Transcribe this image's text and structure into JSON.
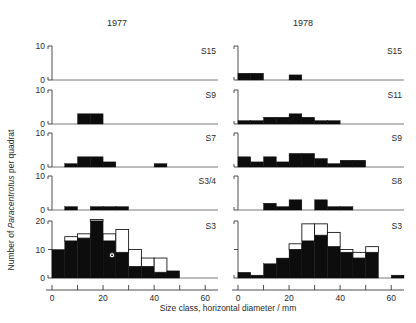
{
  "figure": {
    "column_titles": [
      "1977",
      "1978"
    ],
    "y_axis_label_prefix": "Number of ",
    "y_axis_label_italic": "Paracentrotus",
    "y_axis_label_suffix": " per quadrat",
    "x_axis_label": "Size class, horizontal diameter / mm"
  },
  "chart_data": {
    "type": "bar",
    "title": "",
    "subtitle": "",
    "xlabel": "Size class, horizontal diameter / mm",
    "ylabel": "Number of Paracentrotus per quadrat",
    "grid": false,
    "legend": "none",
    "bin_width": 5,
    "xlim": [
      0,
      65
    ],
    "x_ticks": [
      0,
      10,
      20,
      30,
      40,
      50,
      60
    ],
    "x_tick_labels": [
      "0",
      "20",
      "40",
      "60"
    ],
    "x_labeled_ticks": [
      0,
      20,
      40,
      60
    ],
    "note": "Histograms of sea urchin size-frequency. Solid black bars = one category; open (white outlined) bars stacked above = second category. Rows are sampling sites, columns are years.",
    "panels": [
      {
        "year": "1977",
        "site": "S15",
        "row": 0,
        "column": 0,
        "ylim": [
          0,
          10
        ],
        "y_ticks": [
          0,
          10
        ],
        "y_tick_labels": [
          "0",
          "10"
        ],
        "bins": [
          0,
          5,
          10,
          15,
          20,
          25,
          30,
          35,
          40,
          45,
          50,
          55,
          60
        ],
        "filled": [
          0,
          0,
          0,
          0,
          0,
          0,
          0,
          0,
          0,
          0,
          0,
          0,
          0
        ],
        "open": [
          0,
          0,
          0,
          0,
          0,
          0,
          0,
          0,
          0,
          0,
          0,
          0,
          0
        ]
      },
      {
        "year": "1977",
        "site": "S9",
        "row": 1,
        "column": 0,
        "ylim": [
          0,
          10
        ],
        "y_ticks": [
          0,
          10
        ],
        "y_tick_labels": [
          "0",
          "10"
        ],
        "bins": [
          0,
          5,
          10,
          15,
          20,
          25,
          30,
          35,
          40,
          45,
          50,
          55,
          60
        ],
        "filled": [
          0,
          0,
          3,
          3,
          0,
          0,
          0,
          0,
          0,
          0,
          0,
          0,
          0
        ],
        "open": [
          0,
          0,
          0,
          0,
          0,
          0,
          0,
          0,
          0,
          0,
          0,
          0,
          0
        ]
      },
      {
        "year": "1977",
        "site": "S7",
        "row": 2,
        "column": 0,
        "ylim": [
          0,
          10
        ],
        "y_ticks": [
          0,
          10
        ],
        "y_tick_labels": [
          "0",
          "10"
        ],
        "bins": [
          0,
          5,
          10,
          15,
          20,
          25,
          30,
          35,
          40,
          45,
          50,
          55,
          60
        ],
        "filled": [
          0,
          1,
          3,
          3,
          1.5,
          0,
          0,
          0,
          1,
          0,
          0,
          0,
          0
        ],
        "open": [
          0,
          0,
          0,
          0,
          0,
          0,
          0,
          0,
          0,
          0,
          0,
          0,
          0
        ]
      },
      {
        "year": "1977",
        "site": "S3/4",
        "row": 3,
        "column": 0,
        "ylim": [
          0,
          10
        ],
        "y_ticks": [
          0,
          10
        ],
        "y_tick_labels": [
          "0",
          "10"
        ],
        "bins": [
          0,
          5,
          10,
          15,
          20,
          25,
          30,
          35,
          40,
          45,
          50,
          55,
          60
        ],
        "filled": [
          0,
          1,
          0,
          1,
          1,
          1,
          0,
          0,
          0,
          0,
          0,
          0,
          0
        ],
        "open": [
          0,
          0,
          0,
          0,
          0,
          0,
          0,
          0,
          0,
          0,
          0,
          0,
          0
        ]
      },
      {
        "year": "1977",
        "site": "S3",
        "row": 4,
        "column": 0,
        "ylim": [
          0,
          20
        ],
        "y_ticks": [
          0,
          10,
          20
        ],
        "y_tick_labels": [
          "0",
          "10",
          "20"
        ],
        "bins": [
          0,
          5,
          10,
          15,
          20,
          25,
          30,
          35,
          40,
          45,
          50,
          55,
          60
        ],
        "filled": [
          10,
          13,
          14,
          20,
          13,
          9,
          4,
          4,
          2,
          2.5,
          0,
          0,
          0
        ],
        "open": [
          0,
          1.5,
          1.5,
          0.5,
          2.5,
          8,
          6,
          3,
          5,
          0,
          0,
          0,
          0
        ]
      },
      {
        "year": "1978",
        "site": "S15",
        "row": 0,
        "column": 1,
        "ylim": [
          0,
          10
        ],
        "y_ticks": [
          0,
          10
        ],
        "y_tick_labels": [
          "0",
          "10"
        ],
        "bins": [
          0,
          5,
          10,
          15,
          20,
          25,
          30,
          35,
          40,
          45,
          50,
          55,
          60
        ],
        "filled": [
          2,
          2,
          0,
          0,
          1.5,
          0,
          0,
          0,
          0,
          0,
          0,
          0,
          0
        ],
        "open": [
          0,
          0,
          0,
          0,
          0,
          0,
          0,
          0,
          0,
          0,
          0,
          0,
          0
        ]
      },
      {
        "year": "1978",
        "site": "S11",
        "row": 1,
        "column": 1,
        "ylim": [
          0,
          10
        ],
        "y_ticks": [
          0,
          10
        ],
        "y_tick_labels": [
          "0",
          "10"
        ],
        "bins": [
          0,
          5,
          10,
          15,
          20,
          25,
          30,
          35,
          40,
          45,
          50,
          55,
          60
        ],
        "filled": [
          1,
          1,
          2,
          2,
          3,
          2,
          1,
          1,
          0,
          0,
          0,
          0,
          0
        ],
        "open": [
          0,
          0,
          0,
          0,
          0,
          0,
          0,
          0,
          0,
          0,
          0,
          0,
          0
        ]
      },
      {
        "year": "1978",
        "site": "S9",
        "row": 2,
        "column": 1,
        "ylim": [
          0,
          10
        ],
        "y_ticks": [
          0,
          10
        ],
        "y_tick_labels": [
          "0",
          "10"
        ],
        "bins": [
          0,
          5,
          10,
          15,
          20,
          25,
          30,
          35,
          40,
          45,
          50,
          55,
          60
        ],
        "filled": [
          3,
          1.5,
          3,
          1.5,
          4,
          4,
          2.5,
          1,
          2,
          2,
          0,
          0,
          0
        ],
        "open": [
          0,
          0,
          0,
          0,
          0,
          0,
          0,
          0,
          0,
          0,
          0,
          0,
          0
        ]
      },
      {
        "year": "1978",
        "site": "S8",
        "row": 3,
        "column": 1,
        "ylim": [
          0,
          10
        ],
        "y_ticks": [
          0,
          10
        ],
        "y_tick_labels": [
          "0",
          "10"
        ],
        "bins": [
          0,
          5,
          10,
          15,
          20,
          25,
          30,
          35,
          40,
          45,
          50,
          55,
          60
        ],
        "filled": [
          0,
          0,
          2,
          1,
          3,
          0,
          3,
          1,
          1,
          0,
          0,
          0,
          0
        ],
        "open": [
          0,
          0,
          0,
          0,
          0,
          0,
          0,
          0,
          0,
          0,
          0,
          0,
          0
        ]
      },
      {
        "year": "1978",
        "site": "S3",
        "row": 4,
        "column": 1,
        "ylim": [
          0,
          20
        ],
        "y_ticks": [
          0,
          10,
          20
        ],
        "y_tick_labels": [
          "0",
          "10",
          "20"
        ],
        "bins": [
          0,
          5,
          10,
          15,
          20,
          25,
          30,
          35,
          40,
          45,
          50,
          55,
          60
        ],
        "filled": [
          2,
          1,
          5,
          7,
          10,
          13,
          15,
          11,
          9,
          7,
          9,
          0,
          1
        ],
        "open": [
          0,
          0,
          0,
          0,
          2,
          6,
          4,
          5,
          1,
          2,
          2,
          0,
          0
        ]
      }
    ]
  }
}
